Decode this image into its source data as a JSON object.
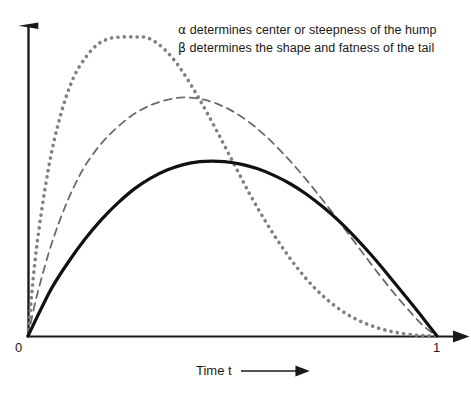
{
  "figure": {
    "width": 471,
    "height": 397,
    "background": "#ffffff"
  },
  "annotations": {
    "alpha_line": "α determines center or steepness of the hump",
    "beta_line": "β determines the shape and fatness of the tail",
    "alpha_symbol": "α",
    "beta_symbol": "β",
    "alpha_text": " determines center or steepness of the hump",
    "beta_text": " determines the shape and fatness of the tail"
  },
  "axes": {
    "x_title": "Time t",
    "x_arrow": "⟶",
    "x_min_label": "0",
    "x_max_label": "1",
    "x_axis_color": "#1a1a1a",
    "y_axis_color": "#1a1a1a"
  },
  "chart_data": {
    "type": "line",
    "title": "",
    "subtitle": "",
    "xlabel": "Time t",
    "ylabel": "",
    "xlim": [
      0,
      1
    ],
    "ylim": [
      0,
      1.05
    ],
    "grid": false,
    "legend": null,
    "legend_position": "none",
    "annotations": [
      "α determines center or steepness of the hump",
      "β determines the shape and fatness of the tail"
    ],
    "x_tick_labels": [
      "0",
      "1"
    ],
    "x_tick_values": [
      0,
      1
    ],
    "y_tick_labels": [],
    "y_tick_values": [],
    "series": [
      {
        "name": "dotted curve",
        "style": "dotted",
        "color": "#808080",
        "width": 3.6,
        "peak_x": 0.29,
        "peak_y": 1.0,
        "x": [
          0.0,
          0.02,
          0.05,
          0.08,
          0.11,
          0.14,
          0.17,
          0.2,
          0.23,
          0.26,
          0.29,
          0.32,
          0.35,
          0.38,
          0.42,
          0.46,
          0.5,
          0.54,
          0.58,
          0.62,
          0.66,
          0.7,
          0.74,
          0.78,
          0.82,
          0.86,
          0.9,
          0.94,
          0.97,
          1.0
        ],
        "y": [
          0.0,
          0.285,
          0.56,
          0.74,
          0.86,
          0.93,
          0.975,
          0.995,
          1.0,
          1.0,
          0.998,
          0.975,
          0.935,
          0.88,
          0.79,
          0.69,
          0.585,
          0.48,
          0.385,
          0.3,
          0.225,
          0.162,
          0.112,
          0.073,
          0.045,
          0.025,
          0.012,
          0.004,
          0.001,
          0.0
        ]
      },
      {
        "name": "dashed curve",
        "style": "dashed",
        "color": "#6b6b6b",
        "width": 1.8,
        "peak_x": 0.38,
        "peak_y": 0.8,
        "x": [
          0.0,
          0.02,
          0.05,
          0.08,
          0.11,
          0.14,
          0.18,
          0.22,
          0.26,
          0.3,
          0.34,
          0.38,
          0.42,
          0.46,
          0.5,
          0.54,
          0.58,
          0.62,
          0.66,
          0.7,
          0.74,
          0.78,
          0.82,
          0.86,
          0.9,
          0.94,
          0.97,
          1.0
        ],
        "y": [
          0.0,
          0.125,
          0.275,
          0.395,
          0.492,
          0.57,
          0.645,
          0.7,
          0.743,
          0.772,
          0.79,
          0.798,
          0.793,
          0.778,
          0.752,
          0.716,
          0.67,
          0.616,
          0.556,
          0.49,
          0.42,
          0.348,
          0.275,
          0.203,
          0.135,
          0.072,
          0.03,
          0.0
        ]
      },
      {
        "name": "solid curve",
        "style": "solid",
        "color": "#111111",
        "width": 3.2,
        "peak_x": 0.45,
        "peak_y": 0.585,
        "x": [
          0.0,
          0.03,
          0.06,
          0.1,
          0.14,
          0.18,
          0.22,
          0.26,
          0.3,
          0.34,
          0.38,
          0.42,
          0.45,
          0.48,
          0.52,
          0.56,
          0.6,
          0.64,
          0.68,
          0.72,
          0.76,
          0.8,
          0.84,
          0.88,
          0.92,
          0.96,
          1.0
        ],
        "y": [
          0.0,
          0.085,
          0.165,
          0.25,
          0.325,
          0.39,
          0.445,
          0.492,
          0.528,
          0.555,
          0.573,
          0.583,
          0.585,
          0.583,
          0.575,
          0.56,
          0.538,
          0.51,
          0.475,
          0.433,
          0.385,
          0.33,
          0.27,
          0.205,
          0.138,
          0.07,
          0.0
        ]
      }
    ]
  }
}
